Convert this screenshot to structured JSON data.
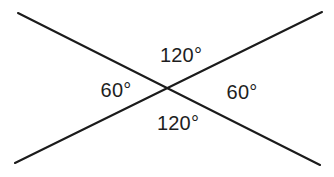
{
  "figure": {
    "kind": "vertical-angles-diagram",
    "background_color": "#ffffff",
    "line_color": "#1b1b1b",
    "label_color": "#1e1e1e",
    "width": 334,
    "height": 177,
    "lines": [
      {
        "name": "descending-line",
        "x1": 18,
        "y1": 13,
        "x2": 320,
        "y2": 165
      },
      {
        "name": "ascending-line",
        "x1": 15,
        "y1": 163,
        "x2": 322,
        "y2": 12
      }
    ],
    "intersection": {
      "x": 166,
      "y": 90
    }
  },
  "labels": {
    "top": "120°",
    "left": "60°",
    "right": "60°",
    "bottom": "120°"
  }
}
